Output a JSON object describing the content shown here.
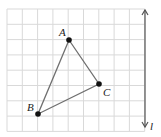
{
  "diagram": {
    "grid": {
      "x0": 7,
      "y0": 9,
      "cell": 15.3,
      "cols": 9,
      "rows": 8,
      "color": "#d9d9d9"
    },
    "triangle": {
      "stroke": "#707070",
      "points": [
        {
          "name": "A",
          "x": 69,
          "y": 40,
          "label_dx": -10,
          "label_dy": -4
        },
        {
          "name": "B",
          "x": 38,
          "y": 114,
          "label_dx": -11,
          "label_dy": -3
        },
        {
          "name": "C",
          "x": 99,
          "y": 84,
          "label_dx": 4,
          "label_dy": 12
        }
      ]
    },
    "line": {
      "name": "l",
      "x": 145,
      "y1": 10,
      "y2": 127,
      "color": "#555555"
    }
  }
}
